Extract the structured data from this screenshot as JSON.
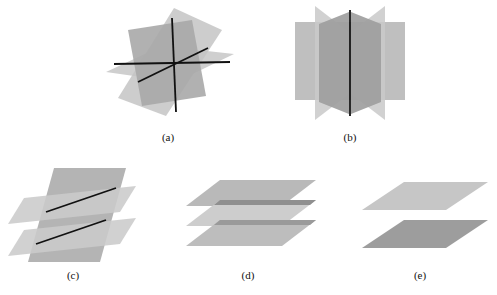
{
  "figure": {
    "title_caption": "",
    "panel_labels": [
      "(a)",
      "(b)",
      "(c)",
      "(d)",
      "(e)"
    ],
    "colors": {
      "plane_light": "#cfcfcf",
      "plane_medium": "#bcbcbc",
      "plane_dark": "#a6a6a6",
      "plane_darker": "#8f8f8f",
      "intersection_line": "#111111",
      "background": "#ffffff"
    },
    "panels": [
      {
        "id": "a",
        "label": "(a)",
        "description": "Three planes intersecting at a single common point",
        "plane_count": 3,
        "intersection_lines": 3,
        "intersection_type": "point"
      },
      {
        "id": "b",
        "label": "(b)",
        "description": "Three planes intersecting along one common line",
        "plane_count": 3,
        "intersection_lines": 1,
        "intersection_type": "line"
      },
      {
        "id": "c",
        "label": "(c)",
        "description": "Two parallel planes cut by a third plane in two parallel lines",
        "plane_count": 3,
        "intersection_lines": 2,
        "intersection_type": "two-parallel-lines"
      },
      {
        "id": "d",
        "label": "(d)",
        "description": "Three parallel planes with no intersection",
        "plane_count": 3,
        "intersection_lines": 0,
        "intersection_type": "none"
      },
      {
        "id": "e",
        "label": "(e)",
        "description": "Two parallel planes with no intersection",
        "plane_count": 2,
        "intersection_lines": 0,
        "intersection_type": "none"
      }
    ]
  }
}
